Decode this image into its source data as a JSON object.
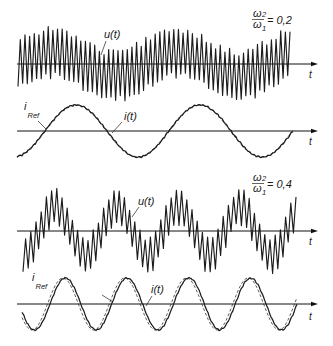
{
  "figure": {
    "top": {
      "u_label": "u(t)",
      "i_label": "i(t)",
      "i_ref_main": "i",
      "i_ref_sub": "Ref",
      "t_axis_u": "t",
      "t_axis_i": "t",
      "ratio": {
        "num": "ω",
        "num_sub": "2",
        "den": "ω",
        "den_sub": "1",
        "value": "= 0,2"
      }
    },
    "bottom": {
      "u_label": "u(t)",
      "i_label": "i(t)",
      "i_ref_main": "i",
      "i_ref_sub": "Ref",
      "t_axis_u": "t",
      "t_axis_i": "t",
      "ratio": {
        "num": "ω",
        "num_sub": "2",
        "den": "ω",
        "den_sub": "1",
        "value": "= 0,4"
      }
    }
  },
  "chart_data": {
    "type": "line",
    "title": "",
    "xlabel": "t",
    "ylabel": "",
    "grid": false,
    "legend": "inline labels",
    "axis_x_end": 318,
    "axis_x_start": 17,
    "panels": [
      {
        "id": "panel-u-ratio-02",
        "series": "u(t)",
        "frequency_ratio": 0.2,
        "kind": "carrier_on_sine",
        "axis_y": 64,
        "x_start": 18,
        "x_end": 292,
        "low_amp": 12,
        "low_period": 124,
        "low_zero_x": 21,
        "carrier_amp": 24,
        "carrier_period": 4.65
      },
      {
        "id": "panel-i-ratio-02",
        "series": [
          "i(t)",
          "i_Ref"
        ],
        "frequency_ratio": 0.2,
        "kind": "sine",
        "axis_y": 131,
        "x_start": 17,
        "x_end": 293,
        "amp": 26,
        "period": 124,
        "zero_x": 45,
        "ripple": 0.9,
        "ref_shift": 0.6
      },
      {
        "id": "panel-u-ratio-04",
        "series": "u(t)",
        "frequency_ratio": 0.4,
        "kind": "carrier_on_sine",
        "axis_y": 231,
        "x_start": 23,
        "x_end": 297,
        "low_amp": 24,
        "low_period": 61.75,
        "low_zero_x": 39.6,
        "carrier_amp": 17,
        "carrier_period": 5.2
      },
      {
        "id": "panel-i-ratio-04",
        "series": [
          "i(t)",
          "i_Ref"
        ],
        "frequency_ratio": 0.4,
        "kind": "sine",
        "axis_y": 304,
        "x_start": 22,
        "x_end": 297,
        "amp": 26,
        "period": 61.75,
        "zero_x": 50,
        "ripple": 0.9,
        "ref_shift": 2.5
      }
    ]
  }
}
